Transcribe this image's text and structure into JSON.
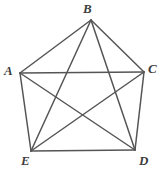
{
  "figure": {
    "name": "pentagon-with-diagonals",
    "background_color": "#ffffff",
    "line_color": "#555555",
    "label_color": "#3d3d3d",
    "vertices": [
      {
        "id": "A",
        "label": "A",
        "x": 20,
        "y": 73,
        "label_x": 4,
        "label_y": 64
      },
      {
        "id": "B",
        "label": "B",
        "x": 91,
        "y": 20,
        "label_x": 83,
        "label_y": 2
      },
      {
        "id": "C",
        "label": "C",
        "x": 144,
        "y": 72,
        "label_x": 148,
        "label_y": 62
      },
      {
        "id": "D",
        "label": "D",
        "x": 135,
        "y": 150,
        "label_x": 139,
        "label_y": 154
      },
      {
        "id": "E",
        "label": "E",
        "x": 31,
        "y": 151,
        "label_x": 21,
        "label_y": 154
      }
    ],
    "edges": [
      {
        "name": "edge-A-B",
        "from": "A",
        "to": "B"
      },
      {
        "name": "edge-B-C",
        "from": "B",
        "to": "C"
      },
      {
        "name": "edge-C-D",
        "from": "C",
        "to": "D"
      },
      {
        "name": "edge-D-E",
        "from": "D",
        "to": "E"
      },
      {
        "name": "edge-E-A",
        "from": "E",
        "to": "A"
      }
    ],
    "diagonals": [
      {
        "name": "diagonal-A-C",
        "from": "A",
        "to": "C"
      },
      {
        "name": "diagonal-A-D",
        "from": "A",
        "to": "D"
      },
      {
        "name": "diagonal-B-D",
        "from": "B",
        "to": "D"
      },
      {
        "name": "diagonal-B-E",
        "from": "B",
        "to": "E"
      },
      {
        "name": "diagonal-C-E",
        "from": "C",
        "to": "E"
      }
    ]
  }
}
